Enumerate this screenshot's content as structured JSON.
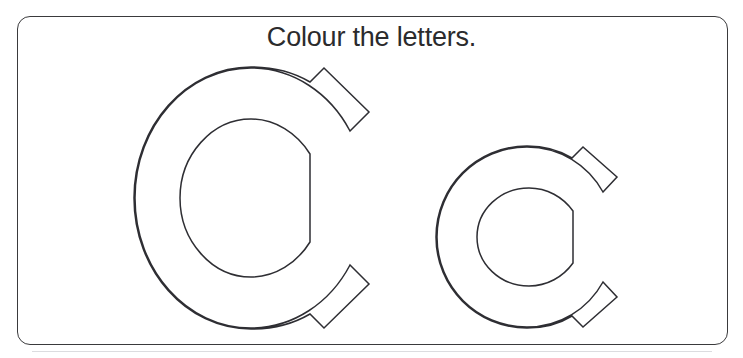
{
  "page": {
    "background_color": "#ffffff",
    "width": 743,
    "height": 358
  },
  "card": {
    "name": "activity-card",
    "border_color": "#3a3a3c",
    "corner_radius": 13,
    "background_color": "#ffffff"
  },
  "instruction": {
    "text": "Colour the letters.",
    "color": "#2b2b2d",
    "align": "center"
  },
  "letters": [
    {
      "character": "C",
      "case": "uppercase",
      "label": "uppercase-letter-c",
      "outline_color": "#2e2e33",
      "fill_color": "#ffffff"
    },
    {
      "character": "c",
      "case": "lowercase",
      "label": "lowercase-letter-c",
      "outline_color": "#2e2e33",
      "fill_color": "#ffffff"
    }
  ],
  "separator": {
    "color": "#dcdcdf"
  }
}
